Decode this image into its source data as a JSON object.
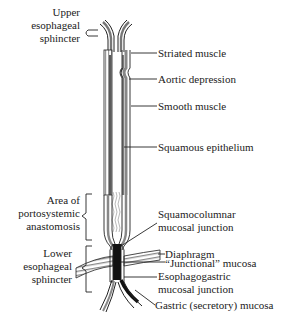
{
  "diagram": {
    "left_labels": {
      "upper_sphincter": [
        "Upper",
        "esophageal",
        "sphincter"
      ],
      "portosystemic": [
        "Area of",
        "portosystemic",
        "anastomosis"
      ],
      "lower_sphincter": [
        "Lower",
        "esophageal",
        "sphincter"
      ]
    },
    "right_labels": {
      "striated": "Striated muscle",
      "aortic": "Aortic depression",
      "smooth": "Smooth muscle",
      "squamous": "Squamous epithelium",
      "squamocolumnar": [
        "Squamocolumnar",
        "mucosal junction"
      ],
      "diaphragm": "Diaphragm",
      "junctional": "“Junctional” mucosa",
      "esophagogastric": [
        "Esophagogastric",
        "mucosal junction"
      ],
      "gastric": "Gastric (secretory) mucosa"
    },
    "colors": {
      "ink": "#222222",
      "hatch": "#888888",
      "background": "#ffffff"
    }
  }
}
